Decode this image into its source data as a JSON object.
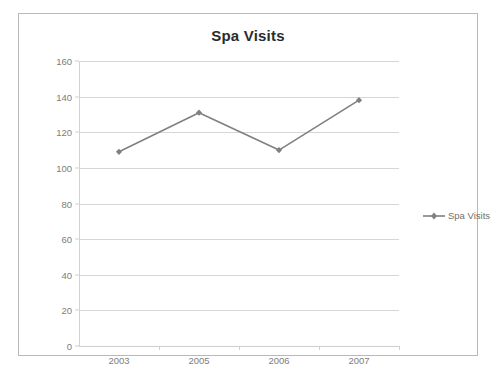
{
  "chart_data": {
    "type": "line",
    "title": "Spa Visits",
    "xlabel": "",
    "ylabel": "",
    "categories": [
      "2003",
      "2005",
      "2006",
      "2007"
    ],
    "series": [
      {
        "name": "Spa Visits",
        "values": [
          109,
          131,
          110,
          138
        ],
        "color": "#808080",
        "marker": "diamond"
      }
    ],
    "ylim": [
      0,
      160
    ],
    "yticks": [
      0,
      20,
      40,
      60,
      80,
      100,
      120,
      140,
      160
    ],
    "ytick_labels": [
      "0",
      "20",
      "40",
      "60",
      "80",
      "100",
      "120",
      "140",
      "160"
    ],
    "grid": true,
    "grid_axis": "y",
    "legend": {
      "position": "right",
      "entries": [
        "Spa Visits"
      ]
    }
  },
  "legend": {
    "label": "Spa Visits",
    "marker_name": "diamond-marker"
  },
  "caption": {
    "text": ""
  },
  "colors": {
    "series": "#808080",
    "grid": "#d6d6d6",
    "axis": "#cfcfcf",
    "tick_text": "#7d7d7d",
    "title_text": "#2b2b2b",
    "frame_border": "#b9b9b9",
    "background": "#ffffff"
  }
}
